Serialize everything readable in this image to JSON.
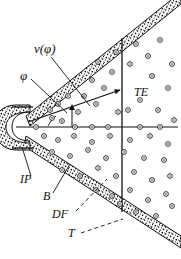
{
  "figure": {
    "background_color": "#ffffff",
    "ink_color": "#111111",
    "width": 181,
    "height": 259
  },
  "labels": {
    "velocity": "v(φ)",
    "angle": "φ",
    "trailing_edge": "TE",
    "impact_point": "IP",
    "boundary": "B",
    "disturbed_flow": "DF",
    "tail": "T"
  },
  "label_positions": {
    "velocity": {
      "x": 34,
      "y": 53
    },
    "angle": {
      "x": 20,
      "y": 80
    },
    "trailing_edge": {
      "x": 134,
      "y": 95
    },
    "impact_point": {
      "x": 22,
      "y": 182
    },
    "boundary": {
      "x": 44,
      "y": 199
    },
    "disturbed_flow": {
      "x": 54,
      "y": 217
    },
    "tail": {
      "x": 68,
      "y": 236
    }
  },
  "geometry": {
    "apex": {
      "x": 24,
      "y": 127
    },
    "axis_y": 127,
    "axis_x_start": 16,
    "axis_x_end": 178,
    "vertical_line_x": 122,
    "vertical_top_y": 38,
    "vertical_bottom_y": 212,
    "upper_band_angle_deg": -34,
    "lower_band_angle_deg": 30,
    "band_thickness": 9,
    "ray_end": {
      "x": 122,
      "y": 89
    }
  },
  "leader_lines": {
    "velocity": {
      "from": {
        "x": 50,
        "y": 58
      },
      "to": {
        "x": 89,
        "y": 105
      }
    },
    "angle": {
      "from": {
        "x": 30,
        "y": 79
      },
      "to": {
        "x": 66,
        "y": 114
      }
    },
    "impact_point": {
      "from": {
        "x": 31,
        "y": 176
      },
      "to": {
        "x": 22,
        "y": 147
      }
    },
    "boundary": {
      "from": {
        "x": 53,
        "y": 193
      },
      "to": {
        "x": 69,
        "y": 165
      }
    },
    "disturbed_flow": {
      "from": {
        "x": 76,
        "y": 212
      },
      "to": {
        "x": 106,
        "y": 180
      },
      "dashed": true
    },
    "tail": {
      "from": {
        "x": 80,
        "y": 233
      },
      "to": {
        "x": 122,
        "y": 219
      },
      "dashed": true
    }
  },
  "stipple": {
    "dot_color": "#111111",
    "description": "dense random speckle fill inside the two conical bands and the nose cap"
  },
  "particles": {
    "glyph": "small open circle with dark center dot",
    "ring_color": "#111111",
    "count_visible": 62,
    "radius": 2.4
  }
}
